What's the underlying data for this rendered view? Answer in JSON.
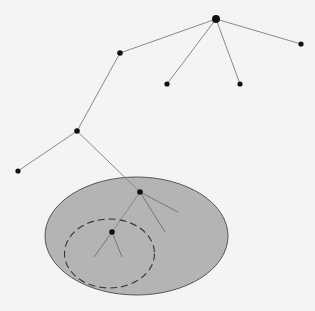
{
  "diagram": {
    "background": "#f4f4f4",
    "edge_color": "#8a8a8a",
    "node_color": "#111111",
    "region": {
      "fill": "#b4b4b4",
      "stroke": "#555555",
      "cx": 136.5,
      "cy": 236,
      "rx": 91.5,
      "ry": 59
    },
    "subregion": {
      "stroke": "#333333",
      "dashed": true,
      "cx": 109.5,
      "cy": 253.5,
      "rx": 45,
      "ry": 34.5
    },
    "nodes": [
      {
        "id": "root",
        "x": 216,
        "y": 19,
        "r": 4
      },
      {
        "id": "leaf-right",
        "x": 301,
        "y": 44,
        "r": 2.6
      },
      {
        "id": "leaf-mid-left",
        "x": 167,
        "y": 84,
        "r": 2.6
      },
      {
        "id": "leaf-mid-right",
        "x": 240,
        "y": 84,
        "r": 2.6
      },
      {
        "id": "node-a",
        "x": 120,
        "y": 53,
        "r": 2.8
      },
      {
        "id": "node-b",
        "x": 77,
        "y": 131,
        "r": 2.8
      },
      {
        "id": "leaf-far-left",
        "x": 18,
        "y": 171,
        "r": 2.6
      },
      {
        "id": "node-c",
        "x": 140,
        "y": 192,
        "r": 2.8
      },
      {
        "id": "node-d",
        "x": 112,
        "y": 232,
        "r": 2.8
      }
    ],
    "edges": [
      {
        "from": "root",
        "to": "leaf-right"
      },
      {
        "from": "root",
        "to": "leaf-mid-left"
      },
      {
        "from": "root",
        "to": "leaf-mid-right"
      },
      {
        "from": "root",
        "to": "node-a"
      },
      {
        "from": "node-a",
        "to": "node-b"
      },
      {
        "from": "node-b",
        "to": "leaf-far-left"
      },
      {
        "from": "node-b",
        "to": "node-c"
      },
      {
        "from": "node-c",
        "to": "node-d"
      }
    ],
    "stub_edges": [
      {
        "x1": 140,
        "y1": 192,
        "x2": 178,
        "y2": 212
      },
      {
        "x1": 140,
        "y1": 192,
        "x2": 165,
        "y2": 232
      },
      {
        "x1": 112,
        "y1": 232,
        "x2": 94,
        "y2": 257
      },
      {
        "x1": 112,
        "y1": 232,
        "x2": 122,
        "y2": 257
      }
    ]
  }
}
